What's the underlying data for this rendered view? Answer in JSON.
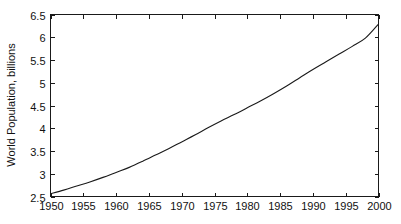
{
  "figure": {
    "background_color": "#ffffff",
    "axis_color": "#1a1a1a",
    "line_color": "#1a1a1a"
  },
  "chart_data": {
    "type": "line",
    "title": "",
    "subtitle": "",
    "xlabel": "",
    "ylabel": "World Population, billions",
    "xlim": [
      1950,
      2000
    ],
    "ylim": [
      2.5,
      6.5
    ],
    "grid": false,
    "legend": false,
    "legend_position": "none",
    "xticks": [
      1950,
      1955,
      1960,
      1965,
      1970,
      1975,
      1980,
      1985,
      1990,
      1995,
      2000
    ],
    "xticklabels": [
      "1950",
      "1955",
      "1960",
      "1965",
      "1970",
      "1975",
      "1980",
      "1985",
      "1990",
      "1995",
      "2000"
    ],
    "yticks": [
      2.5,
      3,
      3.5,
      4,
      4.5,
      5,
      5.5,
      6,
      6.5
    ],
    "yticklabels": [
      "2.5",
      "3",
      "3.5",
      "4",
      "4.5",
      "5",
      "5.5",
      "6",
      "6.5"
    ],
    "series": [
      {
        "name": "World Population",
        "x": [
          1950,
          1952,
          1954,
          1956,
          1958,
          1960,
          1962,
          1964,
          1966,
          1968,
          1970,
          1972,
          1974,
          1976,
          1978,
          1980,
          1982,
          1984,
          1986,
          1988,
          1990,
          1992,
          1994,
          1996,
          1998,
          2000
        ],
        "values": [
          2.56,
          2.64,
          2.73,
          2.82,
          2.92,
          3.03,
          3.14,
          3.27,
          3.41,
          3.55,
          3.7,
          3.85,
          4.01,
          4.16,
          4.3,
          4.45,
          4.6,
          4.76,
          4.93,
          5.11,
          5.29,
          5.46,
          5.63,
          5.8,
          5.98,
          6.29
        ]
      }
    ],
    "annotations": []
  }
}
